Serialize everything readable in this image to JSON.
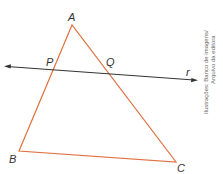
{
  "figure": {
    "vertices": {
      "A": {
        "label": "A",
        "x": 72,
        "y": 25
      },
      "B": {
        "label": "B",
        "x": 19,
        "y": 151
      },
      "C": {
        "label": "C",
        "x": 176,
        "y": 162
      }
    },
    "intersections": {
      "P": {
        "label": "P"
      },
      "Q": {
        "label": "Q"
      }
    },
    "line": {
      "label": "r"
    },
    "colors": {
      "triangle": "#e0703f",
      "line": "#333333"
    }
  },
  "credit": {
    "line1": "Ilustrações: Banco de imagens/",
    "line2": "Arquivo da editora"
  }
}
